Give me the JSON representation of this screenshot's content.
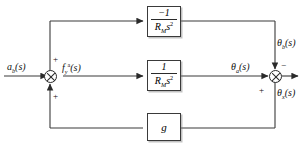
{
  "diagram": {
    "background_color": "#ffffff",
    "line_color": "#3a3a3a",
    "input": {
      "label": "a",
      "subscript": "b",
      "arg": "(s)",
      "name": "input-signal-label"
    },
    "signals": {
      "force": {
        "base": "f",
        "subscript": "y",
        "superscript": "a",
        "arg": "(s)"
      },
      "theta_a": {
        "base": "θ",
        "subscript": "a",
        "arg": "(s)"
      },
      "theta_b": {
        "base": "θ",
        "subscript": "b",
        "arg": "(s)"
      },
      "theta_x": {
        "base": "θ",
        "subscript": "x",
        "arg": "(s)"
      }
    },
    "blocks": [
      {
        "id": "upper",
        "kind": "fraction",
        "numerator": "−1",
        "denominator_base": "R",
        "denominator_sub": "M",
        "denominator_var": "s",
        "denominator_sup": "2",
        "label_plain": "-1 / (R_M s^2)"
      },
      {
        "id": "middle",
        "kind": "fraction",
        "numerator": "1",
        "denominator_base": "R",
        "denominator_sub": "M",
        "denominator_var": "s",
        "denominator_sup": "2",
        "label_plain": "1 / (R_M s^2)"
      },
      {
        "id": "lower",
        "kind": "gain",
        "gain": "g",
        "label_plain": "g"
      }
    ],
    "summing_junctions": [
      {
        "id": "left",
        "name": "summing-junction-left",
        "signs": {
          "top": "+",
          "bottom": "+"
        }
      },
      {
        "id": "right",
        "name": "summing-junction-right",
        "signs": {
          "top": "−",
          "bottom": "+"
        }
      }
    ]
  }
}
